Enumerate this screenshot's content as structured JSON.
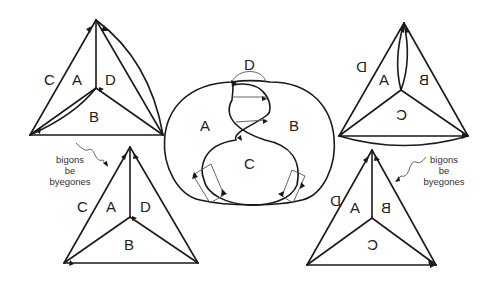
{
  "figure": {
    "top_left": {
      "labels": {
        "c": "C",
        "a": "A",
        "d": "D",
        "b": "B"
      }
    },
    "center": {
      "labels": {
        "d": "D",
        "a": "A",
        "b": "B",
        "c": "C"
      }
    },
    "top_right": {
      "labels": {
        "d": "D",
        "a": "A",
        "b": "B",
        "c": "C"
      }
    },
    "bottom_left": {
      "labels": {
        "c": "C",
        "a": "A",
        "d": "D",
        "b": "B"
      }
    },
    "bottom_right": {
      "labels": {
        "d": "D",
        "a": "A",
        "b": "B",
        "c": "C"
      }
    },
    "annotation_left": {
      "line1": "bigons",
      "line2": "be",
      "line3": "byegones"
    },
    "annotation_right": {
      "line1": "bigons",
      "line2": "be",
      "line3": "byegones"
    }
  }
}
